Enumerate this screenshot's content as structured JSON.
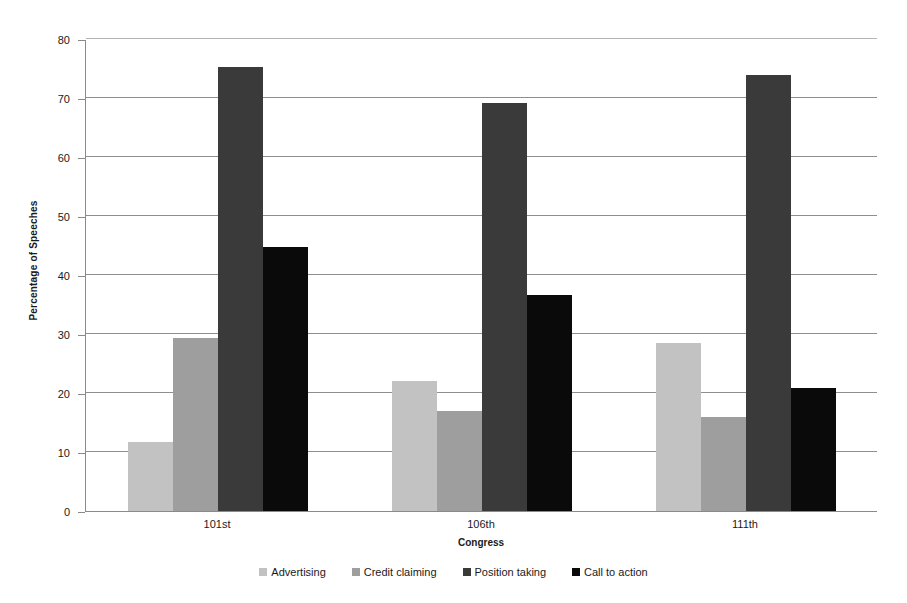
{
  "chart_data": {
    "type": "bar",
    "title": "",
    "xlabel": "Congress",
    "ylabel": "Percentage of Speeches",
    "categories": [
      "101st",
      "106th",
      "111th"
    ],
    "series": [
      {
        "name": "Advertising",
        "color": "#c2c2c2",
        "values": [
          11.7,
          22.0,
          28.4
        ]
      },
      {
        "name": "Credit claiming",
        "color": "#9e9e9e",
        "values": [
          29.4,
          16.9,
          15.9
        ]
      },
      {
        "name": "Position taking",
        "color": "#3a3a3a",
        "values": [
          75.3,
          69.2,
          73.9
        ]
      },
      {
        "name": "Call to action",
        "color": "#0a0a0a",
        "values": [
          44.7,
          36.6,
          20.8
        ]
      }
    ],
    "ylim": [
      0,
      80
    ],
    "yticks": [
      0,
      10,
      20,
      30,
      40,
      50,
      60,
      70,
      80
    ],
    "ytick_labels": [
      "0",
      "10",
      "20",
      "30",
      "40",
      "50",
      "60",
      "70",
      "80"
    ],
    "grid": true,
    "legend_position": "bottom"
  },
  "axis": {
    "y_title": "Percentage of Speeches",
    "x_title": "Congress"
  }
}
